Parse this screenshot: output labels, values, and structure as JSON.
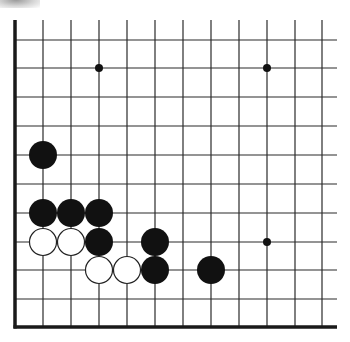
{
  "board": {
    "description": "Go problem diagram, lower-left corner region",
    "columns": 12,
    "rows": 11,
    "x_lines": [
      15,
      43,
      71,
      99,
      127,
      155,
      183,
      211,
      239,
      267,
      295,
      322
    ],
    "y_lines": [
      40,
      68,
      97,
      126,
      155,
      184,
      213,
      242,
      270,
      299,
      327
    ],
    "top": 20,
    "right": 337,
    "left_edge_x": 15,
    "bottom_edge_y": 327,
    "line_color": "#2a2a2a",
    "edge_color": "#1a1a1a",
    "stone_radius": 14
  },
  "star_points": [
    {
      "col": 3,
      "row": 1
    },
    {
      "col": 9,
      "row": 1
    },
    {
      "col": 9,
      "row": 7
    }
  ],
  "stones": {
    "black": [
      {
        "col": 1,
        "row": 4
      },
      {
        "col": 1,
        "row": 6
      },
      {
        "col": 2,
        "row": 6
      },
      {
        "col": 3,
        "row": 6
      },
      {
        "col": 3,
        "row": 7
      },
      {
        "col": 5,
        "row": 7
      },
      {
        "col": 5,
        "row": 8
      },
      {
        "col": 7,
        "row": 8
      }
    ],
    "white": [
      {
        "col": 1,
        "row": 7
      },
      {
        "col": 2,
        "row": 7
      },
      {
        "col": 3,
        "row": 8
      },
      {
        "col": 4,
        "row": 8
      }
    ]
  },
  "colors": {
    "black_stone": "#111111",
    "white_stone_fill": "#ffffff",
    "white_stone_stroke": "#222222",
    "background": "#ffffff"
  }
}
